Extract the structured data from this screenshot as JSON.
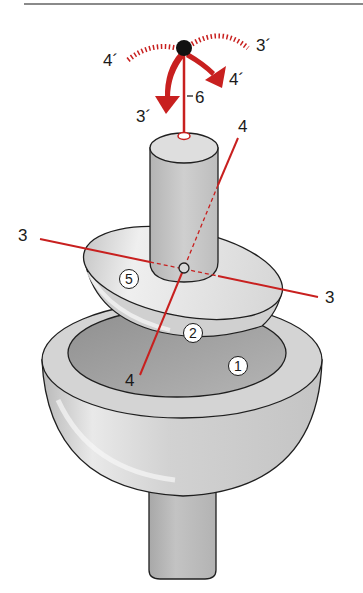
{
  "diagram": {
    "type": "ball-and-socket joint schematic (hemispherical head in cup on stem)",
    "colors": {
      "axis_red": "#c8201f",
      "outline": "#1f1f1f",
      "surface_light": "#dcdcdc",
      "surface_mid": "#bdbdbd",
      "surface_dark": "#9a9a9a",
      "pivot_dot": "#111111",
      "rule": "#8a8a8a"
    },
    "parts": {
      "part_1": "1",
      "part_2": "2",
      "part_5": "5"
    },
    "axis_labels": {
      "axis3_left": "3",
      "axis3_right": "3",
      "axis4_top": "4",
      "axis4_bottom": "4",
      "axis6": "6"
    },
    "rotation_labels": {
      "rot4_left": "4´",
      "rot3_right": "3´",
      "rot4_arrow": "4´",
      "rot3_arrow": "3´"
    }
  }
}
